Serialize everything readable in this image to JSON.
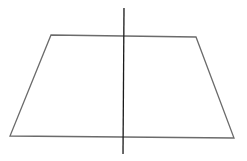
{
  "diagram": {
    "canvas": {
      "width": 247,
      "height": 161,
      "background": "#ffffff"
    },
    "trapezoid": {
      "points": "51,35 196,37 234,138 10,136",
      "stroke": "#6b6b6b",
      "stroke_width": 1.3
    },
    "axis_line": {
      "x1": 124,
      "y1": 8,
      "x2": 123,
      "y2": 154,
      "stroke": "#1a1a1a",
      "stroke_width": 1.3
    }
  }
}
